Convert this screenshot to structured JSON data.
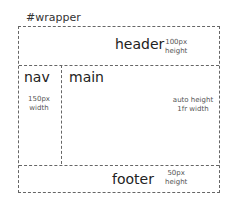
{
  "wrapper": {
    "label": "#wrapper"
  },
  "header": {
    "label": "header",
    "note_line1": "100px",
    "note_line2": "height"
  },
  "nav": {
    "label": "nav",
    "note_line1": "150px",
    "note_line2": "width"
  },
  "main": {
    "label": "main",
    "note_line1": "auto height",
    "note_line2": "1fr width"
  },
  "footer": {
    "label": "footer",
    "note_line1": "50px",
    "note_line2": "height"
  }
}
